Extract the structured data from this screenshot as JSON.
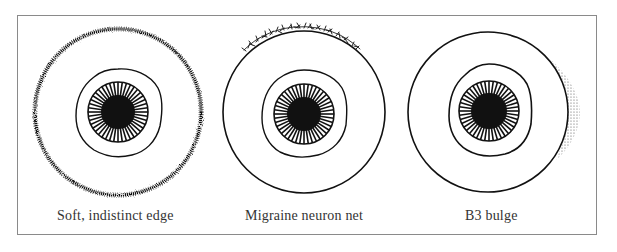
{
  "figure": {
    "panels": [
      {
        "label": "Soft, indistinct edge",
        "feature": "soft-indistinct-edge",
        "center": [
          118,
          112
        ],
        "outer_radius": 83
      },
      {
        "label": "Migraine neuron net",
        "feature": "migraine-neuron-net",
        "center": [
          304,
          112
        ],
        "outer_radius": 81
      },
      {
        "label": "B3 bulge",
        "feature": "b3-bulge",
        "center": [
          488,
          112
        ],
        "outer_radius": 80
      }
    ],
    "colors": {
      "ink": "#111111",
      "frame": "#8a8a8a",
      "background": "#ffffff"
    }
  }
}
